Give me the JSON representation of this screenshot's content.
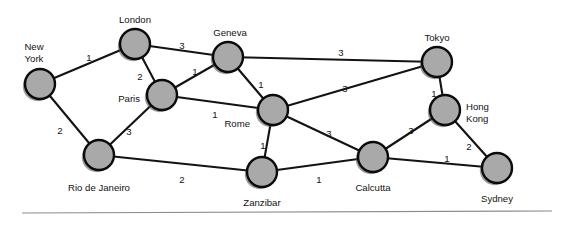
{
  "figure": {
    "background_color": "#ffffff",
    "node_fill_color": "#a9a9a9",
    "node_stroke_color": "#0b0b0b",
    "edge_color": "#131313",
    "label_color": "#131313"
  },
  "chart_data": {
    "type": "diagram",
    "title": "",
    "xlabel": "",
    "ylabel": "",
    "grid": false,
    "legend": "none",
    "nodes": [
      {
        "id": "new_york",
        "label": "New\nYork",
        "label_line1": "New",
        "label_line2": "York",
        "x": 40,
        "y": 84,
        "r": 15,
        "label_x": 34,
        "label_y": 47,
        "label_anchor": "middle"
      },
      {
        "id": "london",
        "label": "London",
        "x": 135,
        "y": 44,
        "r": 15,
        "label_x": 135,
        "label_y": 20,
        "label_anchor": "middle"
      },
      {
        "id": "geneva",
        "label": "Geneva",
        "x": 228,
        "y": 57,
        "r": 15,
        "label_x": 230,
        "label_y": 33,
        "label_anchor": "middle"
      },
      {
        "id": "tokyo",
        "label": "Tokyo",
        "x": 437,
        "y": 62,
        "r": 15,
        "label_x": 437,
        "label_y": 38,
        "label_anchor": "middle"
      },
      {
        "id": "paris",
        "label": "Paris",
        "x": 162,
        "y": 95,
        "r": 15,
        "label_x": 140,
        "label_y": 99,
        "label_anchor": "end"
      },
      {
        "id": "rome",
        "label": "Rome",
        "x": 273,
        "y": 110,
        "r": 15,
        "label_x": 250,
        "label_y": 124,
        "label_anchor": "end"
      },
      {
        "id": "hong_kong",
        "label": "Hong\nKong",
        "label_line1": "Hong",
        "label_line2": "Kong",
        "x": 445,
        "y": 110,
        "r": 15,
        "label_x": 466,
        "label_y": 107,
        "label_anchor": "start"
      },
      {
        "id": "rio_de_janeiro",
        "label": "Rio de Janeiro",
        "x": 99,
        "y": 155,
        "r": 15,
        "label_x": 99,
        "label_y": 188,
        "label_anchor": "middle"
      },
      {
        "id": "zanzibar",
        "label": "Zanzibar",
        "x": 262,
        "y": 172,
        "r": 15,
        "label_x": 262,
        "label_y": 203,
        "label_anchor": "middle"
      },
      {
        "id": "calcutta",
        "label": "Calcutta",
        "x": 373,
        "y": 157,
        "r": 15,
        "label_x": 373,
        "label_y": 188,
        "label_anchor": "middle"
      },
      {
        "id": "sydney",
        "label": "Sydney",
        "x": 497,
        "y": 168,
        "r": 15,
        "label_x": 497,
        "label_y": 199,
        "label_anchor": "middle"
      }
    ],
    "edges": [
      {
        "source": "new_york",
        "target": "london",
        "weight": "1",
        "label_x": 89,
        "label_y": 58
      },
      {
        "source": "new_york",
        "target": "rio_de_janeiro",
        "weight": "2",
        "label_x": 60,
        "label_y": 131
      },
      {
        "source": "london",
        "target": "geneva",
        "weight": "3",
        "label_x": 182,
        "label_y": 46
      },
      {
        "source": "london",
        "target": "paris",
        "weight": "2",
        "label_x": 140,
        "label_y": 77
      },
      {
        "source": "paris",
        "target": "geneva",
        "weight": "1",
        "label_x": 195,
        "label_y": 72
      },
      {
        "source": "paris",
        "target": "rome",
        "weight": "1",
        "label_x": 215,
        "label_y": 115
      },
      {
        "source": "paris",
        "target": "rio_de_janeiro",
        "weight": "3",
        "label_x": 129,
        "label_y": 132
      },
      {
        "source": "geneva",
        "target": "rome",
        "weight": "1",
        "label_x": 261,
        "label_y": 85
      },
      {
        "source": "geneva",
        "target": "tokyo",
        "weight": "3",
        "label_x": 341,
        "label_y": 53
      },
      {
        "source": "rome",
        "target": "tokyo",
        "weight": "3",
        "label_x": 345,
        "label_y": 89
      },
      {
        "source": "rome",
        "target": "zanzibar",
        "weight": "1",
        "label_x": 263,
        "label_y": 146
      },
      {
        "source": "rome",
        "target": "calcutta",
        "weight": "3",
        "label_x": 329,
        "label_y": 134
      },
      {
        "source": "tokyo",
        "target": "hong_kong",
        "weight": "1",
        "label_x": 434,
        "label_y": 94
      },
      {
        "source": "hong_kong",
        "target": "calcutta",
        "weight": "3",
        "label_x": 411,
        "label_y": 131
      },
      {
        "source": "hong_kong",
        "target": "sydney",
        "weight": "2",
        "label_x": 469,
        "label_y": 147
      },
      {
        "source": "calcutta",
        "target": "sydney",
        "weight": "1",
        "label_x": 447,
        "label_y": 159
      },
      {
        "source": "zanzibar",
        "target": "calcutta",
        "weight": "1",
        "label_x": 319,
        "label_y": 180
      },
      {
        "source": "rio_de_janeiro",
        "target": "zanzibar",
        "weight": "2",
        "label_x": 182,
        "label_y": 180
      }
    ]
  },
  "divider": {
    "x1": 22,
    "y1": 213,
    "x2": 552,
    "y2": 211
  }
}
